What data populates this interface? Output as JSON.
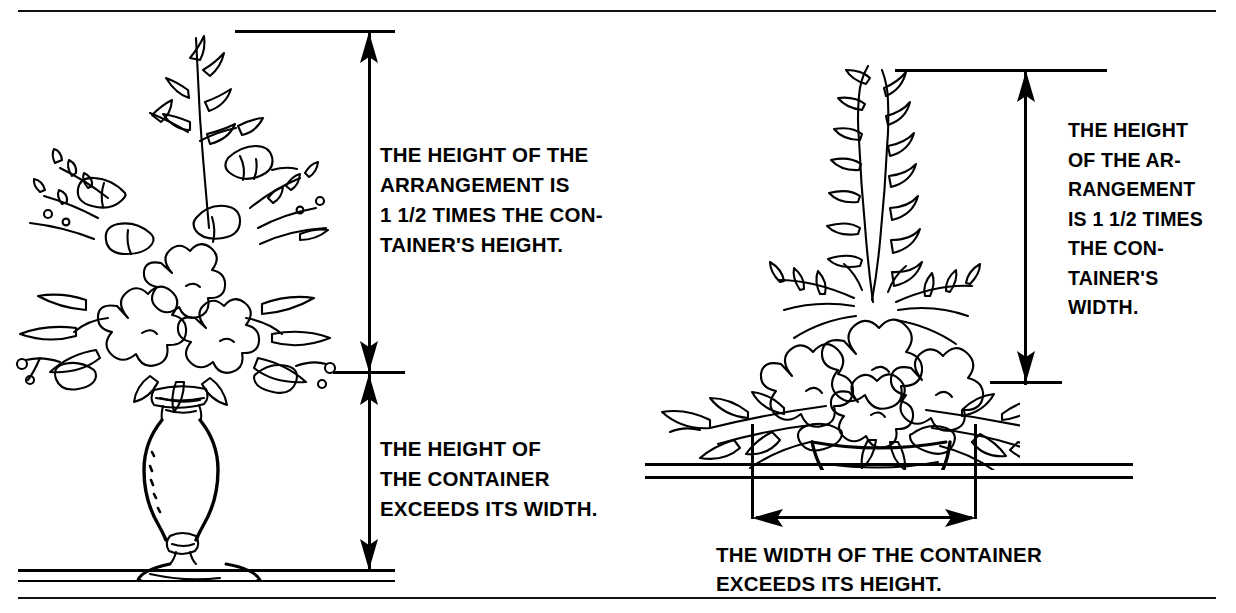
{
  "figure": {
    "background_color": "#ffffff",
    "ink_color": "#000000"
  },
  "left_panel": {
    "name": "tall-container-arrangement",
    "illustration": "line drawing of a tall footed pedestal vase holding a spreading flower arrangement",
    "captions": {
      "upper": "THE HEIGHT OF THE\nARRANGEMENT IS\n1 1/2 TIMES THE CON-\nTAINER'S HEIGHT.",
      "lower": "THE HEIGHT OF\nTHE CONTAINER\nEXCEEDS ITS WIDTH."
    },
    "dimensions": [
      {
        "label": "arrangement height",
        "orientation": "vertical",
        "arrow_style": "double-ended",
        "from_y": 30,
        "to_y": 372
      },
      {
        "label": "container height",
        "orientation": "vertical",
        "arrow_style": "double-ended",
        "from_y": 372,
        "to_y": 570
      }
    ],
    "ratio_note": "1 1/2 : 1"
  },
  "right_panel": {
    "name": "low-container-arrangement",
    "illustration": "line drawing of a low footed compote bowl holding a wide spreading flower arrangement",
    "captions": {
      "upper": "THE HEIGHT\nOF THE AR-\nRANGEMENT\nIS 1 1/2 TIMES\nTHE CON-\nTAINER'S\nWIDTH.",
      "lower": "THE WIDTH OF THE CONTAINER\nEXCEEDS ITS HEIGHT."
    },
    "dimensions": [
      {
        "label": "arrangement height",
        "orientation": "vertical",
        "arrow_style": "double-ended",
        "from_y": 70,
        "to_y": 382
      },
      {
        "label": "container width",
        "orientation": "horizontal",
        "arrow_style": "double-ended",
        "from_x": 752,
        "to_x": 975
      }
    ],
    "ratio_note": "1 1/2 : 1"
  }
}
